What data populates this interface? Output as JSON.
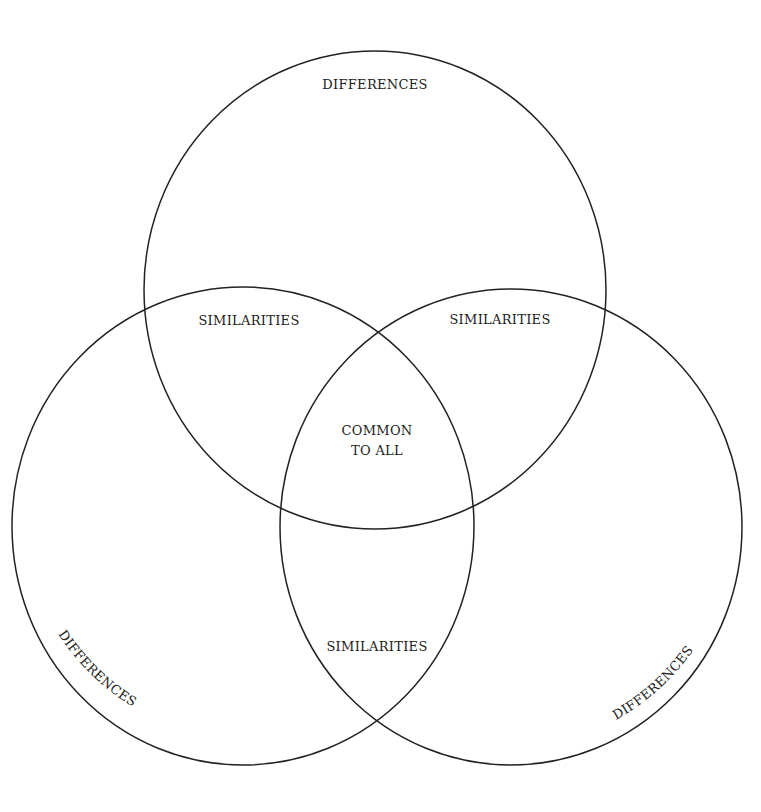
{
  "diagram": {
    "type": "three-circle venn",
    "stroke_color": "#222222",
    "background": "#ffffff",
    "labels": {
      "top_differences": "DIFFERENCES",
      "left_differences": "DIFFERENCES",
      "right_differences": "DIFFERENCES",
      "top_left_similarities": "SIMILARITIES",
      "top_right_similarities": "SIMILARITIES",
      "bottom_similarities": "SIMILARITIES",
      "center_line1": "COMMON",
      "center_line2": "TO ALL"
    }
  }
}
